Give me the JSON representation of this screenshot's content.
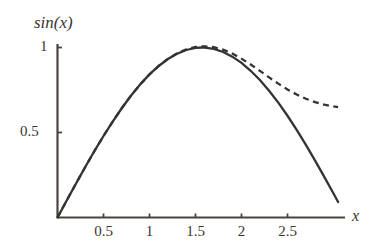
{
  "figure": {
    "background_color": "#ffffff",
    "axis_color": "#4a443e",
    "curve_color": "#333333"
  },
  "axes": {
    "y_title": "sin(x)",
    "x_title": "x",
    "x_ticks": [
      {
        "value": 0.5,
        "label": "0.5",
        "px": 104
      },
      {
        "value": 1,
        "label": "1",
        "px": 150
      },
      {
        "value": 1.5,
        "label": "1.5",
        "px": 196
      },
      {
        "value": 2,
        "label": "2",
        "px": 242
      },
      {
        "value": 2.5,
        "label": "2.5",
        "px": 288
      }
    ],
    "y_ticks": [
      {
        "value": 0.5,
        "label": "0.5",
        "px": 132
      },
      {
        "value": 1,
        "label": "1",
        "px": 47
      }
    ]
  },
  "chart_data": {
    "type": "line",
    "title": "",
    "subtitle": "",
    "xlabel": "x",
    "ylabel": "sin(x)",
    "xlim": [
      0,
      3.1
    ],
    "ylim": [
      0,
      1.05
    ],
    "grid": false,
    "legend": "none",
    "x_tick_labels": [
      "0.5",
      "1",
      "1.5",
      "2",
      "2.5"
    ],
    "x_tick_values": [
      0.5,
      1,
      1.5,
      2,
      2.5
    ],
    "y_tick_labels": [
      "0.5",
      "1"
    ],
    "y_tick_values": [
      0.5,
      1
    ],
    "series": [
      {
        "name": "sin(x)",
        "style": "solid",
        "color": "#333333",
        "x": [
          0,
          0.1,
          0.2,
          0.3,
          0.4,
          0.5,
          0.6,
          0.7,
          0.8,
          0.9,
          1,
          1.1,
          1.2,
          1.3,
          1.4,
          1.5,
          1.5708,
          1.6,
          1.7,
          1.8,
          1.9,
          2,
          2.1,
          2.2,
          2.3,
          2.4,
          2.5,
          2.6,
          2.7,
          2.8,
          2.9,
          3,
          3.05
        ],
        "y": [
          0,
          0.0998,
          0.1987,
          0.2955,
          0.3894,
          0.4794,
          0.5646,
          0.6442,
          0.7174,
          0.7833,
          0.8415,
          0.8912,
          0.932,
          0.9636,
          0.9854,
          0.9975,
          1,
          0.9996,
          0.9917,
          0.9738,
          0.9463,
          0.9093,
          0.8632,
          0.8085,
          0.7457,
          0.6755,
          0.5985,
          0.5155,
          0.4274,
          0.335,
          0.2392,
          0.1411,
          0.0912
        ]
      },
      {
        "name": "approximation",
        "style": "dashed",
        "color": "#333333",
        "x": [
          0,
          0.1,
          0.2,
          0.3,
          0.4,
          0.5,
          0.6,
          0.7,
          0.8,
          0.9,
          1,
          1.1,
          1.2,
          1.3,
          1.4,
          1.5,
          1.5708,
          1.6,
          1.7,
          1.8,
          1.9,
          2,
          2.1,
          2.2,
          2.3,
          2.4,
          2.5,
          2.6,
          2.7,
          2.8,
          2.9,
          3,
          3.05
        ],
        "y": [
          0,
          0.0998,
          0.1987,
          0.2955,
          0.3894,
          0.4794,
          0.5646,
          0.6442,
          0.7175,
          0.7835,
          0.8418,
          0.8918,
          0.9332,
          0.9657,
          0.989,
          1.0029,
          1.006,
          1.0072,
          1.0019,
          0.9872,
          0.9642,
          0.9345,
          0.9,
          0.8625,
          0.8243,
          0.7873,
          0.7533,
          0.7235,
          0.6986,
          0.6787,
          0.6637,
          0.6532,
          0.6494
        ]
      }
    ],
    "annotations": [
      "Solid curve: sin(x). Dashed curve: approximation that matches sin(x) near the origin and diverges after x ~ 2."
    ]
  }
}
